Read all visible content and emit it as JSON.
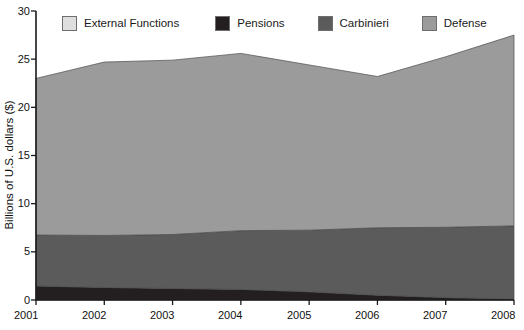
{
  "chart_data": {
    "type": "area",
    "stacked": true,
    "title": "",
    "xlabel": "",
    "ylabel": "Billions of U.S. dollars ($)",
    "x": [
      2001,
      2002,
      2003,
      2004,
      2005,
      2006,
      2007,
      2008
    ],
    "categories": [
      "2001",
      "2002",
      "2003",
      "2004",
      "2005",
      "2006",
      "2007",
      "2008"
    ],
    "xtick_labels": [
      "2001",
      "2002",
      "2003",
      "2004",
      "2005",
      "2006",
      "2007",
      "2008"
    ],
    "ytick_labels": [
      "0",
      "5",
      "10",
      "15",
      "20",
      "25",
      "30"
    ],
    "yticks": [
      0,
      5,
      10,
      15,
      20,
      25,
      30
    ],
    "ylim": [
      0,
      30
    ],
    "xlim": [
      2001,
      2008
    ],
    "grid": false,
    "legend_position": "top",
    "stack_order_bottom_to_top": [
      "Pensions",
      "Carbinieri",
      "Defense",
      "External Functions"
    ],
    "series": [
      {
        "name": "Pensions",
        "color": "#231f20",
        "values": [
          1.45,
          1.3,
          1.2,
          1.1,
          0.85,
          0.5,
          0.25,
          0.1
        ]
      },
      {
        "name": "Carbinieri",
        "color": "#5b5b5b",
        "values": [
          5.3,
          5.4,
          5.6,
          6.1,
          6.4,
          7.0,
          7.3,
          7.6
        ]
      },
      {
        "name": "Defense",
        "color": "#9b9b9b",
        "values": [
          16.25,
          18.0,
          18.1,
          18.4,
          17.15,
          15.7,
          17.7,
          19.8
        ]
      },
      {
        "name": "External Functions",
        "color": "#dedede",
        "values": [
          0,
          0,
          0,
          0,
          0,
          0,
          0,
          0
        ]
      }
    ],
    "cumulative_totals": [
      23.0,
      24.7,
      24.9,
      25.6,
      24.4,
      23.2,
      25.25,
      27.5
    ],
    "cumulative_pensions": [
      1.45,
      1.3,
      1.2,
      1.1,
      0.85,
      0.5,
      0.25,
      0.1
    ],
    "cumulative_pensions_carbinieri": [
      6.75,
      6.7,
      6.8,
      7.2,
      7.25,
      7.5,
      7.55,
      7.7
    ]
  },
  "legend": {
    "entries": [
      {
        "label": "External Functions",
        "color": "#dedede"
      },
      {
        "label": "Pensions",
        "color": "#231f20"
      },
      {
        "label": "Carbinieri",
        "color": "#5b5b5b"
      },
      {
        "label": "Defense",
        "color": "#9b9b9b"
      }
    ]
  },
  "axes": {
    "y_title": "Billions of U.S. dollars ($)",
    "y_ticks": [
      "30",
      "25",
      "20",
      "15",
      "10",
      "5",
      "0"
    ],
    "x_ticks": [
      "2001",
      "2002",
      "2003",
      "2004",
      "2005",
      "2006",
      "2007",
      "2008"
    ]
  },
  "colors": {
    "external_functions": "#dedede",
    "pensions": "#231f20",
    "carbinieri": "#5b5b5b",
    "defense": "#9b9b9b",
    "axis": "#1a1a1a",
    "background": "#ffffff"
  }
}
